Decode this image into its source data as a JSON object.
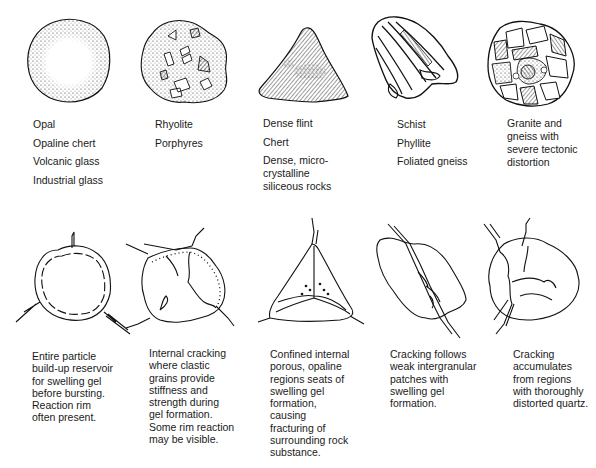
{
  "top_row": [
    {
      "id": "opal",
      "icon": "opal-glass-particle-icon",
      "labels": [
        "Opal",
        "Opaline chert",
        "Volcanic glass",
        "Industrial glass"
      ]
    },
    {
      "id": "rhyolite",
      "icon": "rhyolite-porphyry-particle-icon",
      "labels": [
        "Rhyolite",
        "Porphyres"
      ]
    },
    {
      "id": "flint",
      "icon": "flint-chert-particle-icon",
      "labels": [
        "Dense flint",
        "Chert",
        "Dense, micro-",
        "crystalline",
        "siliceous rocks"
      ]
    },
    {
      "id": "schist",
      "icon": "schist-foliated-particle-icon",
      "labels": [
        "Schist",
        "Phyllite",
        "Foliated gneiss"
      ]
    },
    {
      "id": "granite",
      "icon": "granite-gneiss-particle-icon",
      "labels": [
        "Granite and",
        "gneiss with",
        "severe tectonic",
        "distortion"
      ]
    }
  ],
  "bottom_row": [
    {
      "id": "burst",
      "icon": "cracked-round-particle-icon",
      "caption": [
        "Entire particle",
        "build-up reservoir",
        "for swelling gel",
        "before bursting.",
        "Reaction rim",
        "often present."
      ]
    },
    {
      "id": "internal",
      "icon": "internally-cracked-particle-icon",
      "caption": [
        "Internal cracking",
        "where clastic",
        "grains provide",
        "stiffness and",
        "strength during",
        "gel formation.",
        "Some rim reaction",
        "may be visible."
      ]
    },
    {
      "id": "confined",
      "icon": "triangular-cracked-particle-icon",
      "caption": [
        "Confined internal",
        "porous, opaline",
        "regions seats of",
        "swelling gel",
        "formation,",
        "causing",
        "fracturing of",
        "surrounding rock",
        "substance."
      ]
    },
    {
      "id": "intergranular",
      "icon": "intergranular-crack-particle-icon",
      "caption": [
        "Cracking follows",
        "weak intergranular",
        "patches with",
        "swelling gel",
        "formation."
      ]
    },
    {
      "id": "distorted",
      "icon": "distorted-quartz-crack-particle-icon",
      "caption": [
        "Cracking",
        "accumulates",
        "from regions",
        "with thoroughly",
        "distorted quartz."
      ]
    }
  ]
}
